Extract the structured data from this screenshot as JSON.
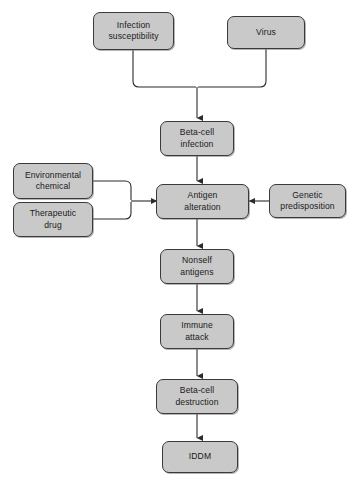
{
  "diagram": {
    "type": "flowchart",
    "title": "",
    "background_color": "#ffffff",
    "node_fill_color": "#c9c9c9",
    "node_border_color": "#3a3a3a",
    "connector_color": "#2b2b2b",
    "nodes": [
      {
        "id": "infection_susceptibility",
        "label": "Infection\nsusceptibility"
      },
      {
        "id": "virus",
        "label": "Virus"
      },
      {
        "id": "beta_cell_infection",
        "label": "Beta-cell\ninfection"
      },
      {
        "id": "environmental_chemical",
        "label": "Environmental\nchemical"
      },
      {
        "id": "therapeutic_drug",
        "label": "Therapeutic\ndrug"
      },
      {
        "id": "antigen_alteration",
        "label": "Antigen\nalteration"
      },
      {
        "id": "genetic_predisposition",
        "label": "Genetic\npredisposition"
      },
      {
        "id": "nonself_antigens",
        "label": "Nonself\nantigens"
      },
      {
        "id": "immune_attack",
        "label": "Immune\nattack"
      },
      {
        "id": "beta_cell_destruction",
        "label": "Beta-cell\ndestruction"
      },
      {
        "id": "iddm",
        "label": "IDDM"
      }
    ],
    "edges": [
      {
        "from": "infection_susceptibility",
        "to": "beta_cell_infection",
        "style": "elbow-merge"
      },
      {
        "from": "virus",
        "to": "beta_cell_infection",
        "style": "elbow-merge"
      },
      {
        "from": "beta_cell_infection",
        "to": "antigen_alteration",
        "style": "straight-down"
      },
      {
        "from": "environmental_chemical",
        "to": "antigen_alteration",
        "style": "elbow-merge-right"
      },
      {
        "from": "therapeutic_drug",
        "to": "antigen_alteration",
        "style": "elbow-merge-right"
      },
      {
        "from": "genetic_predisposition",
        "to": "antigen_alteration",
        "style": "straight-left"
      },
      {
        "from": "antigen_alteration",
        "to": "nonself_antigens",
        "style": "straight-down"
      },
      {
        "from": "nonself_antigens",
        "to": "immune_attack",
        "style": "straight-down"
      },
      {
        "from": "immune_attack",
        "to": "beta_cell_destruction",
        "style": "straight-down"
      },
      {
        "from": "beta_cell_destruction",
        "to": "iddm",
        "style": "straight-down"
      }
    ]
  }
}
